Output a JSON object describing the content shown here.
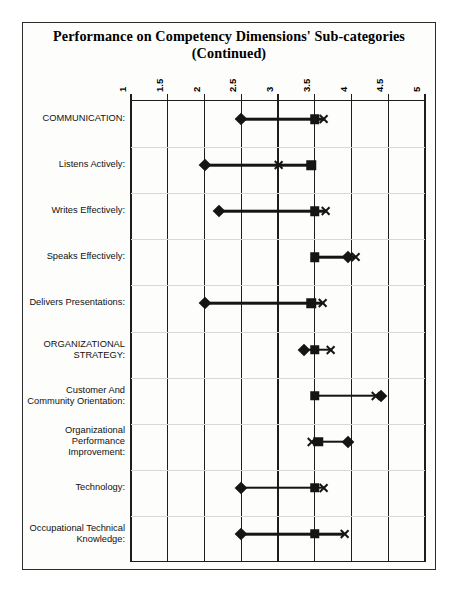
{
  "title": {
    "line1": "Performance on Competency Dimensions' Sub-categories",
    "line2": "(Continued)"
  },
  "chart_data": {
    "type": "scatter",
    "title": "Performance on Competency Dimensions' Sub-categories (Continued)",
    "subtitle": "(Continued)",
    "xlabel": "",
    "ylabel": "",
    "xlim": [
      1,
      5
    ],
    "xticks": [
      "1",
      "1.5",
      "2",
      "2.5",
      "3",
      "3.5",
      "4",
      "4.5",
      "5"
    ],
    "xtick_values": [
      1,
      1.5,
      2,
      2.5,
      3,
      3.5,
      4,
      4.5,
      5
    ],
    "grid": true,
    "legend": "none",
    "orientation": "horizontal",
    "marker_shapes": [
      "diamond",
      "square",
      "cross"
    ],
    "categories": [
      "COMMUNICATION:",
      "Listens Actively:",
      "Writes Effectively:",
      "Speaks Effectively:",
      "Delivers Presentations:",
      "ORGANIZATIONAL STRATEGY:",
      "Customer And Community Orientation:",
      "Organizational Performance Improvement:",
      "Technology:",
      "Occupational Technical Knowledge:"
    ],
    "series": [
      {
        "name": "diamond",
        "marker": "diamond",
        "values": [
          2.5,
          2.0,
          2.2,
          3.95,
          2.0,
          3.35,
          4.4,
          3.95,
          2.5,
          2.5
        ]
      },
      {
        "name": "square",
        "marker": "square",
        "values": [
          3.5,
          3.45,
          3.5,
          3.5,
          3.45,
          3.5,
          3.5,
          3.55,
          3.5,
          3.5
        ]
      },
      {
        "name": "cross",
        "marker": "cross",
        "values": [
          3.62,
          3.0,
          3.65,
          4.05,
          3.6,
          3.72,
          4.33,
          3.45,
          3.62,
          3.9
        ]
      }
    ]
  },
  "rows": [
    {
      "label_lines": [
        "COMMUNICATION:"
      ]
    },
    {
      "label_lines": [
        "Listens Actively:"
      ]
    },
    {
      "label_lines": [
        "Writes Effectively:"
      ]
    },
    {
      "label_lines": [
        "Speaks Effectively:"
      ]
    },
    {
      "label_lines": [
        "Delivers Presentations:"
      ]
    },
    {
      "label_lines": [
        "ORGANIZATIONAL",
        "STRATEGY:"
      ]
    },
    {
      "label_lines": [
        "Customer And",
        "Community Orientation:"
      ]
    },
    {
      "label_lines": [
        "Organizational",
        "Performance",
        "Improvement:"
      ]
    },
    {
      "label_lines": [
        "Technology:"
      ]
    },
    {
      "label_lines": [
        "Occupational Technical",
        "Knowledge:"
      ]
    }
  ],
  "colors": {
    "marker": "#151515",
    "axis": "#1d1d1d",
    "frame": "#2b2b2b",
    "background": "#fdfdfb"
  }
}
